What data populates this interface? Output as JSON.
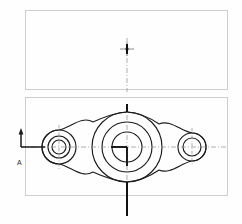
{
  "drawing": {
    "title": "Flanged bearing bracket orthographic drawing",
    "sheet": {
      "width": 242,
      "height": 224,
      "background": "#fefefe"
    },
    "colors": {
      "frame": "#c9c9c9",
      "outline": "#1b1b1b",
      "centerline": "#8c8c8c",
      "section": "#111111",
      "text": "#2a2a2a"
    },
    "views": [
      {
        "name": "elevation-view",
        "type": "rectangle",
        "label": "",
        "frame": {
          "x": 25,
          "y": 10,
          "width": 203,
          "height": 80
        },
        "center_mark": {
          "x": 134,
          "y": 49,
          "size": 9
        }
      },
      {
        "name": "plan-view",
        "type": "profile",
        "label": "",
        "frame": {
          "x": 25,
          "y": 97,
          "width": 203,
          "height": 99
        }
      }
    ],
    "features": {
      "central_boss": {
        "name": "central-boss",
        "cx": 127,
        "cy": 147,
        "radii": [
          35,
          25,
          15,
          9
        ]
      },
      "left_hub": {
        "name": "left-hub",
        "cx": 59,
        "cy": 147,
        "radii": [
          17,
          11,
          7
        ]
      },
      "right_hub": {
        "name": "right-hub",
        "cx": 192,
        "cy": 147,
        "radii": [
          14,
          9
        ]
      }
    },
    "annotations": {
      "section_label": "A",
      "section_label_pos": {
        "x": 17,
        "y": 163
      },
      "section_arrow": {
        "x": 21,
        "y_top": 129,
        "y_bottom": 147
      },
      "section_cut_line_top": {
        "x": 127,
        "y_from": 90,
        "y_to": 113
      },
      "section_cut_line_bottom": {
        "x": 127,
        "y_from": 190,
        "y_to": 218
      },
      "horizontal_centerline": {
        "y": 147,
        "x_from": 21,
        "x_to": 228
      },
      "vertical_centerline": {
        "x": 127,
        "y_from": 38,
        "y_to": 218
      }
    }
  }
}
